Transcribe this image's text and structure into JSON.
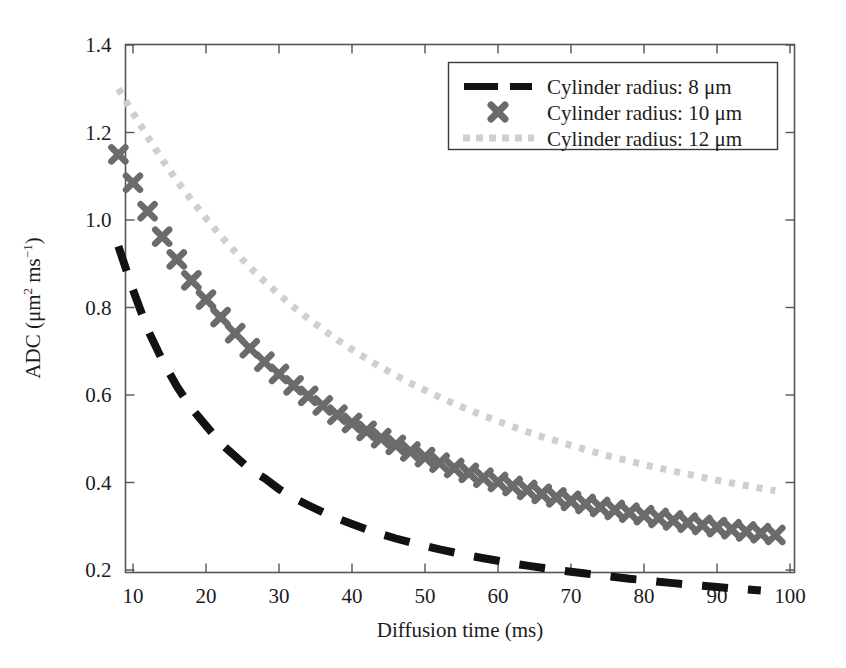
{
  "chart_data": {
    "type": "line",
    "title": "",
    "xlabel": "Diffusion time (ms)",
    "ylabel": "ADC (μm² ms⁻¹)",
    "ylabel_parts": {
      "prefix": "ADC (μm",
      "sup1": "2",
      "mid": " ms",
      "sup2": "−1",
      "suffix": ")"
    },
    "xlim": [
      8,
      100
    ],
    "ylim": [
      0.1,
      1.4
    ],
    "xticks": [
      10,
      20,
      30,
      40,
      50,
      60,
      70,
      80,
      90,
      100
    ],
    "yticks": [
      "0.2",
      "0.4",
      "0.6",
      "0.8",
      "1.0",
      "1.2",
      "1.4"
    ],
    "ytick_values": [
      0.2,
      0.4,
      0.6,
      0.8,
      1.0,
      1.2,
      1.4
    ],
    "grid": false,
    "legend_position": "top-right",
    "series": [
      {
        "name": "Cylinder radius: 8 μm",
        "style": "dashed",
        "color": "#121212",
        "marker": "none",
        "x": [
          8,
          10,
          12,
          14,
          16,
          18,
          20,
          22,
          24,
          26,
          28,
          30,
          32,
          34,
          36,
          38,
          40,
          42,
          44,
          46,
          48,
          50,
          52,
          54,
          56,
          58,
          60,
          62,
          64,
          66,
          68,
          70,
          72,
          74,
          76,
          78,
          80,
          82,
          84,
          86,
          88,
          90,
          92,
          94,
          96
        ],
        "y": [
          0.94,
          0.84,
          0.75,
          0.68,
          0.62,
          0.57,
          0.53,
          0.49,
          0.46,
          0.43,
          0.41,
          0.385,
          0.365,
          0.348,
          0.332,
          0.318,
          0.305,
          0.293,
          0.282,
          0.272,
          0.263,
          0.255,
          0.247,
          0.24,
          0.233,
          0.227,
          0.221,
          0.215,
          0.21,
          0.205,
          0.2,
          0.196,
          0.192,
          0.188,
          0.184,
          0.18,
          0.177,
          0.173,
          0.17,
          0.167,
          0.164,
          0.161,
          0.158,
          0.156,
          0.153
        ]
      },
      {
        "name": "Cylinder radius: 10 μm",
        "style": "markers",
        "color": "#6b6b6b",
        "marker": "x",
        "x": [
          8,
          10,
          12,
          14,
          16,
          18,
          20,
          22,
          24,
          26,
          28,
          30,
          32,
          34,
          36,
          38,
          40,
          42,
          44,
          46,
          48,
          50,
          52,
          54,
          56,
          58,
          60,
          62,
          64,
          66,
          68,
          70,
          72,
          74,
          76,
          78,
          80,
          82,
          84,
          86,
          88,
          90,
          92,
          94,
          96,
          98
        ],
        "y": [
          1.15,
          1.085,
          1.02,
          0.962,
          0.91,
          0.862,
          0.818,
          0.778,
          0.741,
          0.707,
          0.676,
          0.648,
          0.622,
          0.598,
          0.576,
          0.555,
          0.536,
          0.518,
          0.501,
          0.486,
          0.471,
          0.458,
          0.445,
          0.433,
          0.422,
          0.411,
          0.401,
          0.392,
          0.383,
          0.374,
          0.366,
          0.358,
          0.351,
          0.344,
          0.337,
          0.331,
          0.325,
          0.319,
          0.313,
          0.308,
          0.303,
          0.298,
          0.293,
          0.288,
          0.284,
          0.28
        ]
      },
      {
        "name": "Cylinder radius: 12 μm",
        "style": "dotted",
        "color": "#cfcfcf",
        "marker": "none",
        "x": [
          8,
          10,
          12,
          14,
          16,
          18,
          20,
          22,
          24,
          26,
          28,
          30,
          32,
          34,
          36,
          38,
          40,
          42,
          44,
          46,
          48,
          50,
          52,
          54,
          56,
          58,
          60,
          62,
          64,
          66,
          68,
          70,
          72,
          74,
          76,
          78,
          80,
          82,
          84,
          86,
          88,
          90,
          92,
          94,
          96,
          98
        ],
        "y": [
          1.3,
          1.245,
          1.19,
          1.138,
          1.09,
          1.046,
          1.004,
          0.964,
          0.927,
          0.892,
          0.86,
          0.83,
          0.801,
          0.775,
          0.75,
          0.726,
          0.704,
          0.683,
          0.663,
          0.645,
          0.627,
          0.611,
          0.595,
          0.58,
          0.566,
          0.553,
          0.54,
          0.528,
          0.516,
          0.505,
          0.495,
          0.485,
          0.475,
          0.466,
          0.457,
          0.449,
          0.441,
          0.433,
          0.426,
          0.419,
          0.412,
          0.405,
          0.399,
          0.393,
          0.387,
          0.381
        ]
      }
    ]
  },
  "legend": {
    "entries": [
      {
        "label": "Cylinder radius: 8 μm",
        "swatch": "dashed-line-swatch"
      },
      {
        "label": "Cylinder radius: 10 μm",
        "swatch": "x-marker-swatch"
      },
      {
        "label": "Cylinder radius: 12 μm",
        "swatch": "dotted-line-swatch"
      }
    ]
  },
  "colors": {
    "series_1": "#121212",
    "series_2": "#6b6b6b",
    "series_3": "#cfcfcf",
    "axis": "#555555",
    "text": "#1c1c1c",
    "background": "#ffffff"
  }
}
